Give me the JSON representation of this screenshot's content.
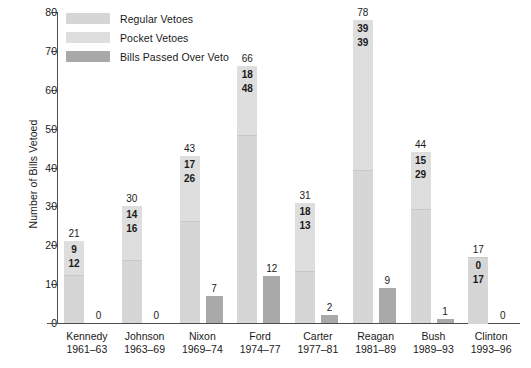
{
  "chart_data": {
    "type": "bar",
    "title": "",
    "xlabel": "",
    "ylabel": "Number of Bills Vetoed",
    "ylim": [
      0,
      80
    ],
    "yticks": [
      0,
      10,
      20,
      30,
      40,
      50,
      60,
      70,
      80
    ],
    "grid": false,
    "legend_position": "top-left",
    "stacked": true,
    "categories": [
      "Kennedy",
      "Johnson",
      "Nixon",
      "Ford",
      "Carter",
      "Reagan",
      "Bush",
      "Clinton"
    ],
    "category_years": [
      "1961–63",
      "1963–69",
      "1969–74",
      "1974–77",
      "1977–81",
      "1981–89",
      "1989–93",
      "1993–96"
    ],
    "series": [
      {
        "name": "Regular Vetoes",
        "color": "#d6d6d6",
        "values": [
          12,
          16,
          26,
          48,
          13,
          39,
          29,
          17
        ]
      },
      {
        "name": "Pocket Vetoes",
        "color": "#dedede",
        "values": [
          9,
          14,
          17,
          18,
          18,
          39,
          15,
          0
        ]
      },
      {
        "name": "Bills Passed Over Veto",
        "color": "#a9a9a9",
        "values": [
          0,
          0,
          7,
          12,
          2,
          9,
          1,
          0
        ]
      }
    ],
    "totals": [
      21,
      30,
      43,
      66,
      31,
      78,
      44,
      17
    ]
  },
  "legend": {
    "items": [
      {
        "label": "Regular Vetoes",
        "color": "#d6d6d6"
      },
      {
        "label": "Pocket Vetoes",
        "color": "#dedede"
      },
      {
        "label": "Bills Passed Over Veto",
        "color": "#a9a9a9"
      }
    ]
  },
  "axes": {
    "y_title": "Number of Bills Vetoed",
    "y_ticks": [
      "0",
      "10",
      "20",
      "30",
      "40",
      "50",
      "60",
      "70",
      "80"
    ]
  },
  "groups": [
    {
      "name": "Kennedy",
      "years": "1961–63",
      "total": "21",
      "pocket": "9",
      "regular": "12",
      "override": "0"
    },
    {
      "name": "Johnson",
      "years": "1963–69",
      "total": "30",
      "pocket": "14",
      "regular": "16",
      "override": "0"
    },
    {
      "name": "Nixon",
      "years": "1969–74",
      "total": "43",
      "pocket": "17",
      "regular": "26",
      "override": "7"
    },
    {
      "name": "Ford",
      "years": "1974–77",
      "total": "66",
      "pocket": "18",
      "regular": "48",
      "override": "12"
    },
    {
      "name": "Carter",
      "years": "1977–81",
      "total": "31",
      "pocket": "18",
      "regular": "13",
      "override": "2"
    },
    {
      "name": "Reagan",
      "years": "1981–89",
      "total": "78",
      "pocket": "39",
      "regular": "39",
      "override": "9"
    },
    {
      "name": "Bush",
      "years": "1989–93",
      "total": "44",
      "pocket": "15",
      "regular": "29",
      "override": "1"
    },
    {
      "name": "Clinton",
      "years": "1993–96",
      "total": "17",
      "pocket": "0",
      "regular": "17",
      "override": "0"
    }
  ]
}
